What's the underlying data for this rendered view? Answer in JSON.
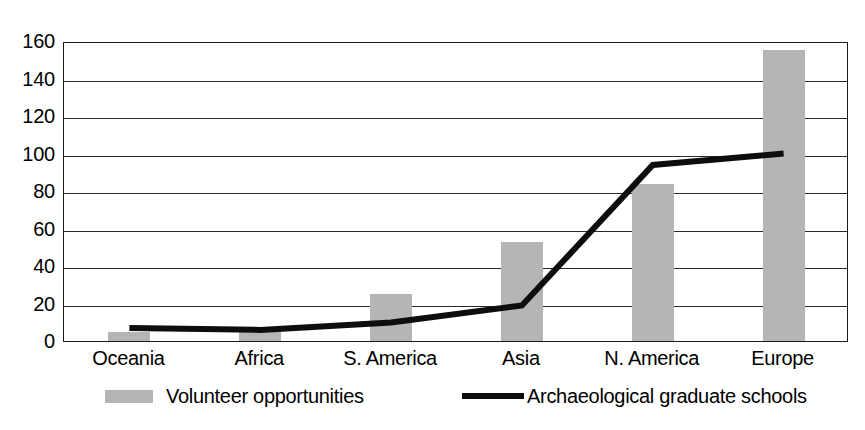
{
  "chart_data": {
    "type": "bar",
    "title": "",
    "subtitle": "",
    "xlabel": "",
    "ylabel": "",
    "ylim": [
      0,
      160
    ],
    "ytick_step": 20,
    "yticks": [
      0,
      20,
      40,
      60,
      80,
      100,
      120,
      140,
      160
    ],
    "grid": true,
    "legend_position": "bottom",
    "categories": [
      "Oceania",
      "Africa",
      "S. America",
      "Asia",
      "N. America",
      "Europe"
    ],
    "series": [
      {
        "name": "Volunteer opportunities",
        "type": "bar",
        "color": "#b5b5b5",
        "values": [
          5,
          6,
          25,
          53,
          84,
          155
        ]
      },
      {
        "name": "Archaeological graduate schools",
        "type": "line",
        "color": "#0d0d0d",
        "values": [
          8,
          7,
          11,
          20,
          95,
          101
        ]
      }
    ]
  },
  "legend": {
    "items": [
      {
        "label": "Volunteer opportunities",
        "marker": "bar-swatch",
        "color": "#b5b5b5"
      },
      {
        "label": "Archaeological graduate schools",
        "marker": "line-swatch",
        "color": "#0d0d0d"
      }
    ]
  },
  "axes": {
    "y_tick_labels": [
      "160",
      "140",
      "120",
      "100",
      "80",
      "60",
      "40",
      "20",
      "0"
    ],
    "x_tick_labels": [
      "Oceania",
      "Africa",
      "S. America",
      "Asia",
      "N. America",
      "Europe"
    ]
  }
}
